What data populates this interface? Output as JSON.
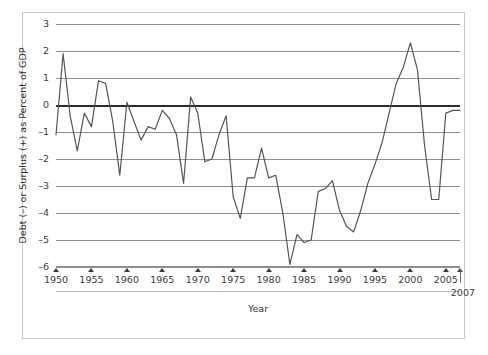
{
  "chart_data": {
    "type": "line",
    "title": "",
    "xlabel": "Year",
    "ylabel": "Debt (–) or Surplus (+) as Percent of GDP",
    "xlim": [
      1950,
      2007
    ],
    "ylim": [
      -6,
      3
    ],
    "grid": true,
    "legend": null,
    "zero_line": 0,
    "y_ticks": [
      3,
      2,
      1,
      0,
      -1,
      -2,
      -3,
      -4,
      -5,
      -6
    ],
    "y_tick_labels": [
      "3",
      "2",
      "1",
      "0",
      "–1",
      "–2",
      "–3",
      "–4",
      "–5",
      "–6"
    ],
    "x_ticks": [
      1950,
      1955,
      1960,
      1965,
      1970,
      1975,
      1980,
      1985,
      1990,
      1995,
      2000,
      2005,
      2007
    ],
    "x_tick_labels": [
      "1950",
      "1955",
      "1960",
      "1965",
      "1970",
      "1975",
      "1980",
      "1985",
      "1990",
      "1995",
      "2000",
      "2005",
      "2007"
    ],
    "end_label": "2007",
    "line_color": "#555555",
    "grid_color": "#8e8e8e",
    "zero_line_color": "#2b2b2b",
    "series": [
      {
        "name": "Debt (–) or Surplus (+) as Percent of GDP",
        "x": [
          1950,
          1951,
          1952,
          1953,
          1954,
          1955,
          1956,
          1957,
          1958,
          1959,
          1960,
          1961,
          1962,
          1963,
          1964,
          1965,
          1966,
          1967,
          1968,
          1969,
          1970,
          1971,
          1972,
          1973,
          1974,
          1975,
          1976,
          1977,
          1978,
          1979,
          1980,
          1981,
          1982,
          1983,
          1984,
          1985,
          1986,
          1987,
          1988,
          1989,
          1990,
          1991,
          1992,
          1993,
          1994,
          1995,
          1996,
          1997,
          1998,
          1999,
          2000,
          2001,
          2002,
          2003,
          2004,
          2005,
          2006,
          2007
        ],
        "y": [
          -1.1,
          1.9,
          -0.4,
          -1.7,
          -0.3,
          -0.8,
          0.9,
          0.8,
          -0.6,
          -2.6,
          0.1,
          -0.6,
          -1.3,
          -0.8,
          -0.9,
          -0.2,
          -0.5,
          -1.1,
          -2.9,
          0.3,
          -0.3,
          -2.1,
          -2.0,
          -1.1,
          -0.4,
          -3.4,
          -4.2,
          -2.7,
          -2.7,
          -1.6,
          -2.7,
          -2.6,
          -4.0,
          -5.9,
          -4.8,
          -5.1,
          -5.0,
          -3.2,
          -3.1,
          -2.8,
          -3.9,
          -4.5,
          -4.7,
          -3.9,
          -2.9,
          -2.2,
          -1.4,
          -0.3,
          0.8,
          1.4,
          2.3,
          1.3,
          -1.5,
          -3.5,
          -3.5,
          -0.3,
          -0.2,
          -0.2
        ]
      }
    ]
  },
  "figure": {
    "x_axis_title": "Year",
    "y_axis_title": "Debt (–) or Surplus (+) as Percent of GDP",
    "end_year_label": "2007"
  }
}
